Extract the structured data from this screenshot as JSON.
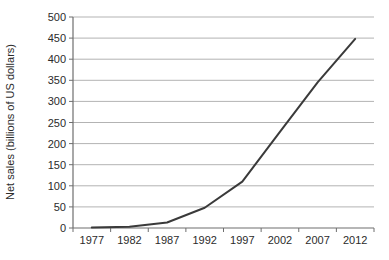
{
  "chart_data": {
    "type": "line",
    "title": "",
    "xlabel": "",
    "ylabel": "Net sales (billions of US dollars)",
    "categories": [
      "1977",
      "1982",
      "1987",
      "1992",
      "1997",
      "2002",
      "2007",
      "2012"
    ],
    "series": [
      {
        "name": "Net sales",
        "values": [
          1,
          3,
          13,
          48,
          110,
          228,
          345,
          448
        ]
      }
    ],
    "y_ticks": [
      0,
      50,
      100,
      150,
      200,
      250,
      300,
      350,
      400,
      450,
      500
    ],
    "ylim": [
      0,
      500
    ],
    "grid": "horizontal",
    "legend": "none",
    "colors": {
      "line": "#3a3a3a",
      "grid": "#b3b3b3",
      "axis": "#6e6e6e",
      "text": "#2b2b2b",
      "background": "#ffffff"
    }
  }
}
